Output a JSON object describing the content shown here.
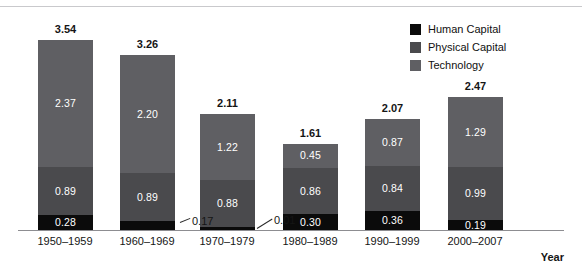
{
  "chart_data": {
    "type": "bar",
    "subtype": "stacked-bar",
    "title": "",
    "xlabel": "Year",
    "ylabel": "",
    "grid": false,
    "legend_position": "top-right",
    "categories": [
      "1950–1959",
      "1960–1969",
      "1970–1979",
      "1980–1989",
      "1990–1999",
      "2000–2007"
    ],
    "series": [
      {
        "name": "Human Capital",
        "color": "#0b0b0b",
        "values": [
          0.28,
          0.17,
          0.01,
          0.3,
          0.36,
          0.19
        ],
        "labels": [
          "0.28",
          "0.17",
          "0.01",
          "0.30",
          "0.36",
          "0.19"
        ]
      },
      {
        "name": "Physical Capital",
        "color": "#4a4a4d",
        "values": [
          0.89,
          0.89,
          0.88,
          0.86,
          0.84,
          0.99
        ],
        "labels": [
          "0.89",
          "0.89",
          "0.88",
          "0.86",
          "0.84",
          "0.99"
        ]
      },
      {
        "name": "Technology",
        "color": "#5f5f63",
        "values": [
          2.37,
          2.2,
          1.22,
          0.45,
          0.87,
          1.29
        ],
        "labels": [
          "2.37",
          "2.20",
          "1.22",
          "0.45",
          "0.87",
          "1.29"
        ]
      }
    ],
    "totals": [
      3.54,
      3.26,
      2.11,
      1.61,
      2.07,
      2.47
    ],
    "total_labels": [
      "3.54",
      "3.26",
      "2.11",
      "1.61",
      "2.07",
      "2.47"
    ],
    "ylim": [
      0,
      3.54
    ],
    "stack_order_bottom_to_top": [
      "Human Capital",
      "Physical Capital",
      "Technology"
    ],
    "external_labels": [
      {
        "category": "1960–1969",
        "series": "Human Capital",
        "text": "0.17"
      },
      {
        "category": "1970–1979",
        "series": "Human Capital",
        "text": "0.01"
      }
    ]
  },
  "legend": {
    "items": [
      {
        "label": "Human Capital",
        "color": "#0b0b0b"
      },
      {
        "label": "Physical Capital",
        "color": "#4a4a4d"
      },
      {
        "label": "Technology",
        "color": "#5f5f63"
      }
    ]
  },
  "axis": {
    "x_title": "Year",
    "tick_labels": [
      "1950–1959",
      "1960–1969",
      "1970–1979",
      "1980–1989",
      "1990–1999",
      "2000–2007"
    ]
  },
  "bars": [
    {
      "category": "1950–1959",
      "total": "3.54",
      "human": "0.28",
      "physical": "0.89",
      "technology": "2.37"
    },
    {
      "category": "1960–1969",
      "total": "3.26",
      "human": "0.17",
      "physical": "0.89",
      "technology": "2.20"
    },
    {
      "category": "1970–1979",
      "total": "2.11",
      "human": "0.01",
      "physical": "0.88",
      "technology": "1.22"
    },
    {
      "category": "1980–1989",
      "total": "1.61",
      "human": "0.30",
      "physical": "0.86",
      "technology": "0.45"
    },
    {
      "category": "1990–1999",
      "total": "2.07",
      "human": "0.36",
      "physical": "0.84",
      "technology": "0.87"
    },
    {
      "category": "2000–2007",
      "total": "2.47",
      "human": "0.19",
      "physical": "0.99",
      "technology": "1.29"
    }
  ]
}
